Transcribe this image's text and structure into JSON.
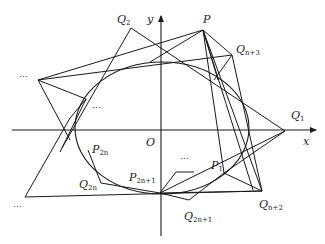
{
  "figure": {
    "type": "geometry-diagram",
    "axes": {
      "x_label": "x",
      "y_label": "y",
      "origin_label": "O"
    },
    "points": {
      "P": {
        "name": "P",
        "sub": ""
      },
      "Q1": {
        "name": "Q",
        "sub": "1"
      },
      "Q2": {
        "name": "Q",
        "sub": "2"
      },
      "Qn3": {
        "name": "Q",
        "sub": "n+3"
      },
      "Qn2": {
        "name": "Q",
        "sub": "n+2"
      },
      "Q2n": {
        "name": "Q",
        "sub": "2n"
      },
      "Q2n1": {
        "name": "Q",
        "sub": "2n+1"
      },
      "P1": {
        "name": "P",
        "sub": "1"
      },
      "P2n": {
        "name": "P",
        "sub": "2n"
      },
      "P2n1": {
        "name": "P",
        "sub": "2n+1"
      }
    },
    "ellipsis_marks": [
      "…",
      "…",
      "…",
      "…"
    ],
    "colors": {
      "stroke": "#1a1a1a",
      "background": "#ffffff"
    }
  }
}
